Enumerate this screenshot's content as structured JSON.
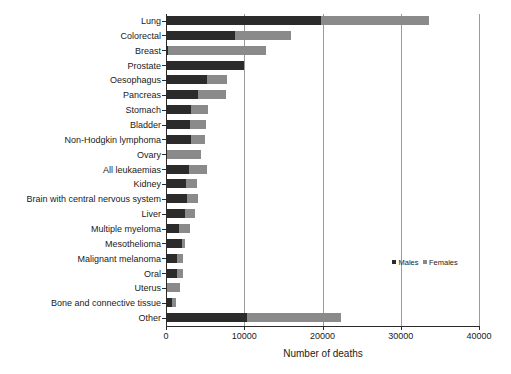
{
  "chart_data": {
    "type": "bar",
    "orientation": "horizontal",
    "stacked": true,
    "title": "",
    "xlabel": "Number of deaths",
    "ylabel": "",
    "xlim": [
      0,
      40000
    ],
    "xticks": [
      0,
      10000,
      20000,
      30000,
      40000
    ],
    "xtick_labels": [
      "0",
      "10000",
      "20000",
      "30000",
      "40000"
    ],
    "grid": "vertical",
    "legend_position": "middle-right",
    "categories": [
      "Lung",
      "Colorectal",
      "Breast",
      "Prostate",
      "Oesophagus",
      "Pancreas",
      "Stomach",
      "Bladder",
      "Non-Hodgkin lymphoma",
      "Ovary",
      "All leukaemias",
      "Kidney",
      "Brain with central nervous system",
      "Liver",
      "Multiple myeloma",
      "Mesothelioma",
      "Malignant melanoma",
      "Oral",
      "Uterus",
      "Bone and connective tissue",
      "Other"
    ],
    "series": [
      {
        "name": "Males",
        "color": "#2b2b2b",
        "values": [
          19700,
          8700,
          100,
          9800,
          5100,
          4000,
          3100,
          3000,
          3100,
          0,
          2800,
          2400,
          2500,
          2300,
          1500,
          1900,
          1300,
          1300,
          0,
          700,
          10200
        ]
      },
      {
        "name": "Females",
        "color": "#8a8a8a",
        "values": [
          13800,
          7200,
          12600,
          0,
          2600,
          3600,
          2200,
          2000,
          1700,
          4300,
          2300,
          1400,
          1400,
          1300,
          1400,
          400,
          800,
          700,
          1700,
          500,
          12100
        ]
      }
    ],
    "totals": [
      33500,
      15900,
      12700,
      9800,
      7700,
      7600,
      5300,
      5000,
      4800,
      4300,
      5100,
      3800,
      3900,
      3600,
      2900,
      2300,
      2100,
      2000,
      1700,
      1200,
      22300
    ]
  },
  "legend": {
    "items": [
      {
        "label": "Males",
        "color": "#2b2b2b"
      },
      {
        "label": "Females",
        "color": "#8a8a8a"
      }
    ]
  },
  "axes": {
    "x_title": "Number of deaths"
  },
  "header": {
    "partial_title": ""
  }
}
